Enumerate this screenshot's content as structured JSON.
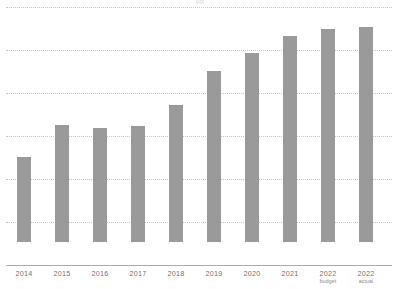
{
  "chart_data": {
    "type": "bar",
    "title": "",
    "subtitle": "",
    "xlabel": "",
    "ylabel": "",
    "categories": [
      "2014",
      "2015",
      "2016",
      "2017",
      "2018",
      "2019",
      "2020",
      "2021",
      "2022",
      "2022"
    ],
    "category_sublabels": [
      "",
      "",
      "",
      "",
      "",
      "",
      "",
      "",
      "budget",
      "actual"
    ],
    "values": [
      1.98,
      2.72,
      2.65,
      2.7,
      3.19,
      3.98,
      4.4,
      4.79,
      4.95,
      5.0
    ],
    "ylim": [
      0,
      6
    ],
    "y_gridline_values": [
      1,
      2,
      3,
      4,
      5,
      6
    ],
    "y_tick_labels": [],
    "grid": true,
    "grid_style": "dotted-horizontal",
    "legend": null,
    "legend_position": "none",
    "series": [
      {
        "name": "",
        "values": [
          1.98,
          2.72,
          2.65,
          2.7,
          3.19,
          3.98,
          4.4,
          4.79,
          4.95,
          5.0
        ]
      }
    ]
  },
  "style": {
    "bar_color": "#9a9a9a",
    "gridline_color": "#c3c5cb",
    "axis_color": "#a9abb0",
    "label_color": "#6f7176",
    "sublabel_color": "#85878c",
    "background": "#ffffff"
  }
}
